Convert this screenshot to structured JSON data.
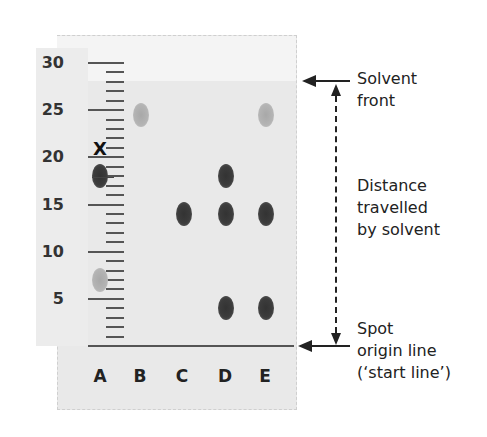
{
  "diagram": {
    "ruler": {
      "labels": [
        "30",
        "25",
        "20",
        "15",
        "10",
        "5"
      ],
      "unit_range": [
        0,
        30
      ]
    },
    "lanes": [
      "A",
      "B",
      "C",
      "D",
      "E"
    ],
    "marker_label": "X",
    "spots": [
      {
        "lane": "A",
        "position": 18,
        "shade": "dark"
      },
      {
        "lane": "A",
        "position": 7,
        "shade": "light"
      },
      {
        "lane": "B",
        "position": 24.5,
        "shade": "light"
      },
      {
        "lane": "C",
        "position": 14,
        "shade": "dark"
      },
      {
        "lane": "D",
        "position": 18,
        "shade": "dark"
      },
      {
        "lane": "D",
        "position": 14,
        "shade": "dark"
      },
      {
        "lane": "D",
        "position": 4,
        "shade": "dark"
      },
      {
        "lane": "E",
        "position": 24.5,
        "shade": "light"
      },
      {
        "lane": "E",
        "position": 14,
        "shade": "dark"
      },
      {
        "lane": "E",
        "position": 4,
        "shade": "dark"
      }
    ],
    "annotations": {
      "solvent_front": [
        "Solvent",
        "front"
      ],
      "distance": [
        "Distance",
        "travelled",
        "by solvent"
      ],
      "origin": [
        "Spot",
        "origin line",
        "(‘start line’)"
      ]
    },
    "colors": {
      "paper": "#e9e9e9",
      "spot_dark": "#3a3a3a",
      "spot_light": "#b0b0b0",
      "line": "#222222"
    }
  }
}
